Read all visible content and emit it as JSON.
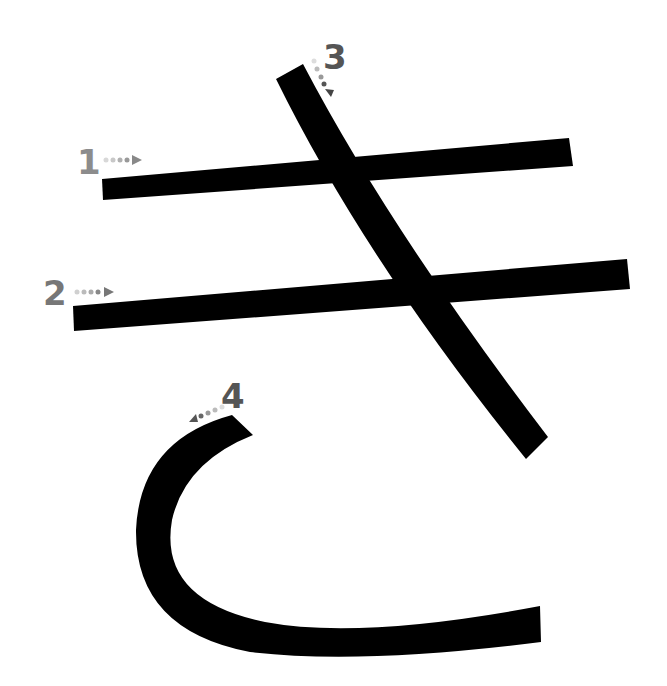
{
  "diagram": {
    "character": "き",
    "stroke_color": "#000000",
    "label_color": "#666666",
    "strokes": [
      {
        "number": "1",
        "label_color": "#8c8c8c",
        "direction": "left-to-right"
      },
      {
        "number": "2",
        "label_color": "#777777",
        "direction": "left-to-right"
      },
      {
        "number": "3",
        "label_color": "#555555",
        "direction": "top-to-bottom-right"
      },
      {
        "number": "4",
        "label_color": "#555555",
        "direction": "curve-down-left-then-right"
      }
    ]
  }
}
